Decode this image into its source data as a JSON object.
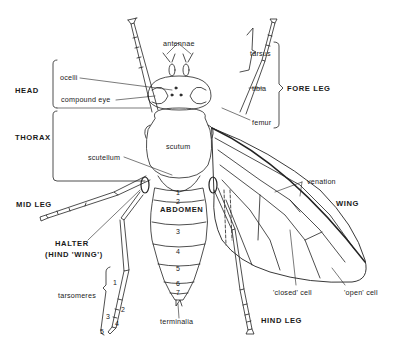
{
  "figure": {
    "regions": {
      "head": "HEAD",
      "thorax": "THORAX",
      "abdomen": "ABDOMEN",
      "fore_leg": "FORE  LEG",
      "mid_leg": "MID  LEG",
      "hind_leg": "HIND  LEG",
      "wing": "WING",
      "halter_line1": "HALTER",
      "halter_line2": "(HIND  'WING')"
    },
    "parts": {
      "antennae": "antennae",
      "ocelli": "ocelli",
      "compound_eye": "compound  eye",
      "scutum": "scutum",
      "scutellum": "scutellum",
      "tarsus": "tarsus",
      "tibia": "tibia",
      "femur": "femur",
      "venation": "venation",
      "closed_cell": "'closed'  cell",
      "open_cell": "'open'  cell",
      "terminalia": "terminalia",
      "tarsomeres": "tarsomeres"
    },
    "abdominal_segments": [
      "1",
      "2",
      "3",
      "4",
      "5",
      "6",
      "7"
    ],
    "tarsomere_numbers": [
      "1",
      "2",
      "3",
      "4",
      "5"
    ]
  }
}
